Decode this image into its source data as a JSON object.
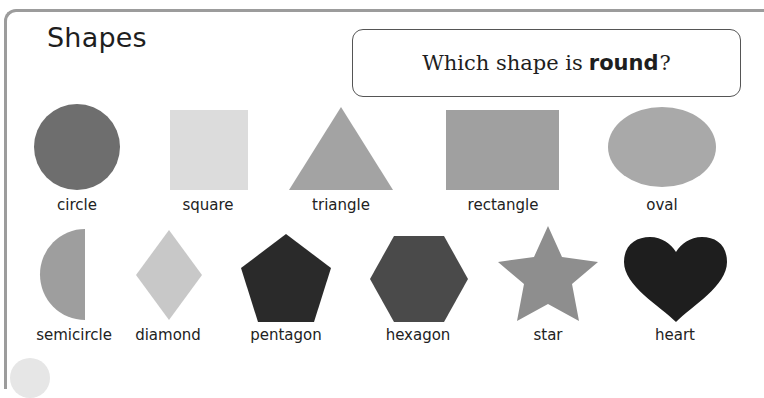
{
  "page": {
    "title": "Shapes",
    "question": {
      "prefix": "Which shape is",
      "emphasis": "round",
      "suffix": "?"
    }
  },
  "shapes": {
    "row1": [
      {
        "name": "circle",
        "label": "circle",
        "color": "#6e6e6e"
      },
      {
        "name": "square",
        "label": "square",
        "color": "#dcdcdc"
      },
      {
        "name": "triangle",
        "label": "triangle",
        "color": "#a3a3a3"
      },
      {
        "name": "rectangle",
        "label": "rectangle",
        "color": "#a0a0a0"
      },
      {
        "name": "oval",
        "label": "oval",
        "color": "#a9a9a9"
      }
    ],
    "row2": [
      {
        "name": "semicircle",
        "label": "semicircle",
        "color": "#9e9e9e"
      },
      {
        "name": "diamond",
        "label": "diamond",
        "color": "#c8c8c8"
      },
      {
        "name": "pentagon",
        "label": "pentagon",
        "color": "#2a2a2a"
      },
      {
        "name": "hexagon",
        "label": "hexagon",
        "color": "#4a4a4a"
      },
      {
        "name": "star",
        "label": "star",
        "color": "#8e8e8e"
      },
      {
        "name": "heart",
        "label": "heart",
        "color": "#1e1e1e"
      }
    ]
  }
}
